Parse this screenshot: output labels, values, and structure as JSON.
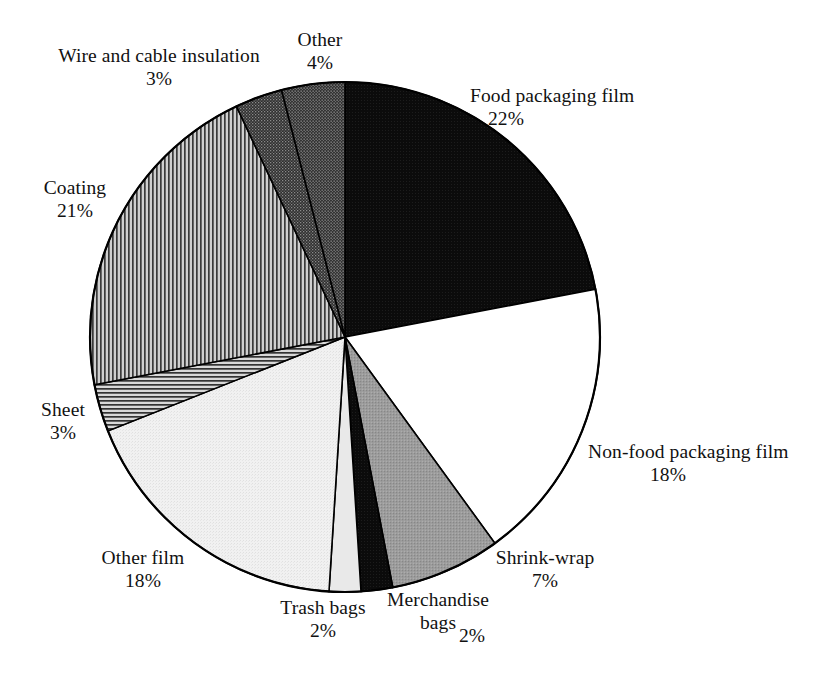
{
  "chart_data": {
    "type": "pie",
    "title": "",
    "subtitle": "",
    "xlabel": "",
    "ylabel": "",
    "legend_position": "none",
    "grid": false,
    "units": "percent",
    "start_angle_deg": 0,
    "direction": "clockwise",
    "categories": [
      "Food packaging film",
      "Non-food packaging film",
      "Shrink-wrap",
      "Merchandise bags",
      "Trash bags",
      "Other film",
      "Sheet",
      "Coating",
      "Wire and cable insulation",
      "Other"
    ],
    "values": [
      22,
      18,
      7,
      2,
      2,
      18,
      3,
      21,
      3,
      4
    ],
    "value_labels": [
      "22%",
      "18%",
      "7%",
      "2%",
      "2%",
      "18%",
      "3%",
      "21%",
      "3%",
      "4%"
    ],
    "slice_fills": [
      "solid-black",
      "solid-white",
      "solid-medium-gray",
      "solid-black",
      "solid-light-gray",
      "solid-very-light-gray",
      "horizontal-hatch",
      "vertical-hatch",
      "dark-stipple",
      "dark-stipple"
    ],
    "colors": {
      "food_packaging_film": "#0d0d0d",
      "non_food_packaging_film": "#ffffff",
      "shrink_wrap": "#9a9a9a",
      "merchandise_bags": "#0d0d0d",
      "trash_bags": "#e8e8e8",
      "other_film": "#efefef",
      "sheet": "#8f8f8f",
      "coating": "#8c8c8c",
      "wire_and_cable_insulation": "#4e4e4e",
      "other": "#4e4e4e",
      "outline": "#000000",
      "background": "#ffffff",
      "text": "#111111"
    }
  },
  "labels": {
    "food": {
      "name": "Food packaging film",
      "value": "22%"
    },
    "nonfood": {
      "name": "Non-food packaging film",
      "value": "18%"
    },
    "shrink": {
      "name": "Shrink-wrap",
      "value": "7%"
    },
    "merch_line1": "Merchandise",
    "merch_line2": "bags",
    "merch_value": "2%",
    "trash": {
      "name": "Trash bags",
      "value": "2%"
    },
    "otherfilm": {
      "name": "Other film",
      "value": "18%"
    },
    "sheet": {
      "name": "Sheet",
      "value": "3%"
    },
    "coating": {
      "name": "Coating",
      "value": "21%"
    },
    "wire": {
      "name": "Wire and cable insulation",
      "value": "3%"
    },
    "other": {
      "name": "Other",
      "value": "4%"
    }
  }
}
